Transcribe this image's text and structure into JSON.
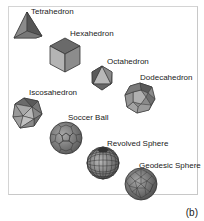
{
  "figure": {
    "caption": "(b)",
    "items": [
      {
        "name": "Tetrahedron",
        "label": "Tetrahedron"
      },
      {
        "name": "Hexahedron",
        "label": "Hexahedron"
      },
      {
        "name": "Octahedron",
        "label": "Octahedron"
      },
      {
        "name": "Dodecahedron",
        "label": "Dodecahedron"
      },
      {
        "name": "Icosahedron",
        "label": "Iscosahedron"
      },
      {
        "name": "Soccer Ball",
        "label": "Soccer Ball"
      },
      {
        "name": "Revolved Sphere",
        "label": "Revolved Sphere"
      },
      {
        "name": "Geodesic Sphere",
        "label": "Geodesic Sphere"
      }
    ]
  }
}
